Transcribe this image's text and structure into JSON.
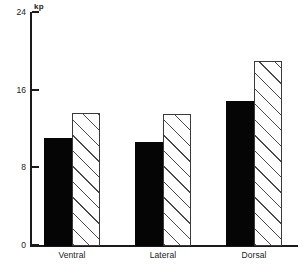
{
  "chart_data": {
    "type": "bar",
    "title": "",
    "xlabel": "",
    "ylabel": "kp",
    "unit_label": "kp",
    "categories": [
      "Ventral",
      "Lateral",
      "Dorsal"
    ],
    "ylim": [
      0,
      24
    ],
    "yticks": [
      0,
      8,
      16,
      24
    ],
    "ytick_labels": [
      "0",
      "8",
      "16",
      "24"
    ],
    "grid": false,
    "legend": "none",
    "series": [
      {
        "name": "solid",
        "fill": "solid-black",
        "color": "#050505",
        "values": [
          11.1,
          10.7,
          14.9
        ]
      },
      {
        "name": "hatched",
        "fill": "diagonal-hatch",
        "color": "#ffffff",
        "values": [
          13.7,
          13.6,
          19.1
        ]
      }
    ]
  },
  "axis": {
    "unit": "kp",
    "ticks": [
      {
        "label": "24",
        "value": 24
      },
      {
        "label": "16",
        "value": 16
      },
      {
        "label": "8",
        "value": 8
      },
      {
        "label": "0",
        "value": 0
      }
    ]
  },
  "groups": [
    {
      "label": "Ventral",
      "solid": 11.1,
      "hatched": 13.7
    },
    {
      "label": "Lateral",
      "solid": 10.7,
      "hatched": 13.6
    },
    {
      "label": "Dorsal",
      "solid": 14.9,
      "hatched": 19.1
    }
  ],
  "colors": {
    "axis": "#1a1a1a",
    "solid_bar": "#050505",
    "hatch_line": "#4a4a4a",
    "hatch_background": "#ffffff",
    "text": "#1a1a1a"
  }
}
